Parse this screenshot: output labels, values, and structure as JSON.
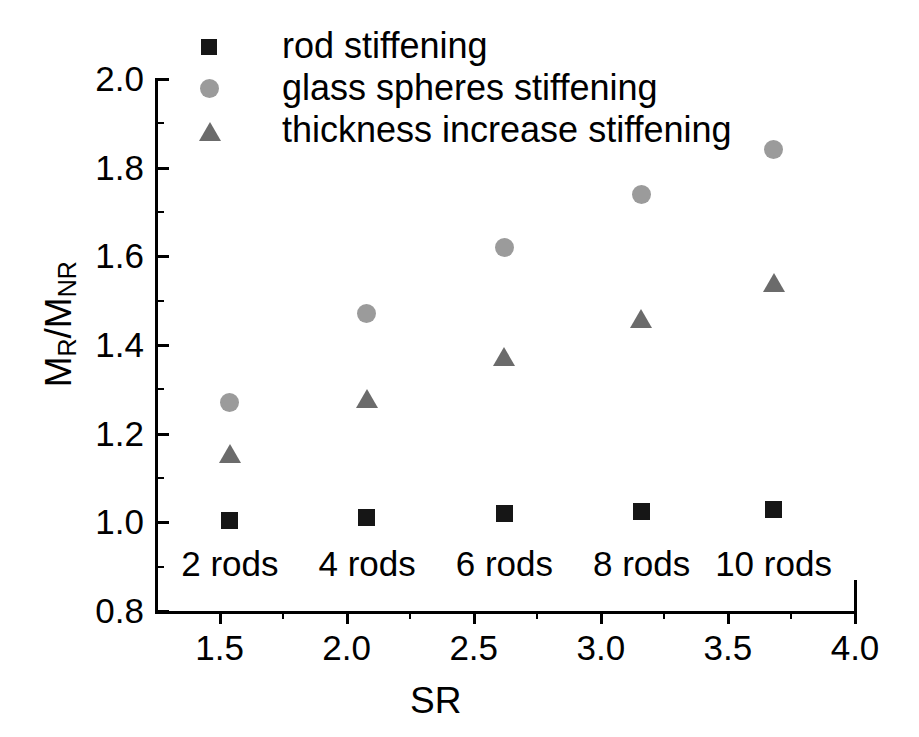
{
  "chart_data": {
    "type": "scatter",
    "title": "",
    "xlabel": "SR",
    "ylabel": "M_R/M_NR",
    "ylabel_parts": {
      "m1": "M",
      "sub1": "R",
      "slash": "/",
      "m2": "M",
      "sub2": "NR"
    },
    "xlim": [
      1.25,
      4.0
    ],
    "ylim": [
      0.8,
      2.0
    ],
    "grid": false,
    "legend_position": "top-left-inside",
    "x": [
      1.54,
      2.08,
      2.62,
      3.16,
      3.68
    ],
    "xticks": [
      1.5,
      2.0,
      2.5,
      3.0,
      3.5,
      4.0
    ],
    "xtick_labels": [
      "1.5",
      "2.0",
      "2.5",
      "3.0",
      "3.5",
      "4.0"
    ],
    "xminor_ticks": [
      1.75,
      2.25,
      2.75,
      3.25,
      3.75
    ],
    "yticks": [
      0.8,
      1.0,
      1.2,
      1.4,
      1.6,
      1.8,
      2.0
    ],
    "ytick_labels": [
      "0.8",
      "1.0",
      "1.2",
      "1.4",
      "1.6",
      "1.8",
      "2.0"
    ],
    "yminor_ticks": [
      0.9,
      1.1,
      1.3,
      1.5,
      1.7,
      1.9
    ],
    "series": [
      {
        "name": "rod stiffening",
        "marker": "square",
        "color": "#161616",
        "values": [
          1.005,
          1.01,
          1.02,
          1.025,
          1.03
        ]
      },
      {
        "name": "glass spheres stiffening",
        "marker": "circle",
        "color": "#9b9b9b",
        "values": [
          1.27,
          1.47,
          1.62,
          1.74,
          1.84
        ]
      },
      {
        "name": "thickness increase stiffening",
        "marker": "triangle",
        "color": "#6b6b6b",
        "values": [
          1.155,
          1.28,
          1.375,
          1.46,
          1.54
        ]
      }
    ],
    "annotations": [
      {
        "text": "2 rods",
        "x": 1.54,
        "y": 0.905
      },
      {
        "text": "4 rods",
        "x": 2.08,
        "y": 0.905
      },
      {
        "text": "6 rods",
        "x": 2.62,
        "y": 0.905
      },
      {
        "text": "8 rods",
        "x": 3.16,
        "y": 0.905
      },
      {
        "text": "10 rods",
        "x": 3.68,
        "y": 0.905
      }
    ]
  },
  "legend": {
    "items": [
      {
        "label": "rod stiffening",
        "marker": "square"
      },
      {
        "label": "glass spheres stiffening",
        "marker": "circle"
      },
      {
        "label": "thickness increase stiffening",
        "marker": "triangle"
      }
    ]
  }
}
